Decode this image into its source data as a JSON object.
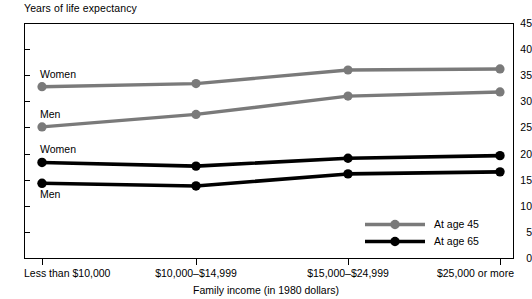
{
  "chart_data": {
    "type": "line",
    "title": "Black",
    "ylabel": "Years of life expectancy",
    "xlabel": "Family income (in 1980 dollars)",
    "categories": [
      "Less than $10,000",
      "$10,000–$14,999",
      "$15,000–$24,999",
      "$25,000 or more"
    ],
    "ylim": [
      0,
      45
    ],
    "yticks": [
      0,
      5,
      10,
      15,
      20,
      25,
      30,
      35,
      40,
      45
    ],
    "ytick_labels": [
      "0",
      "5",
      "10",
      "15",
      "20",
      "25",
      "30",
      "35",
      "40",
      "45"
    ],
    "grid": false,
    "legend_position": "inside-bottom-right",
    "series": [
      {
        "name": "At age 45 — Women",
        "label": "Women",
        "group": "At age 45",
        "color": "#7a7a7a",
        "values": [
          32.8,
          33.4,
          36.0,
          36.2
        ]
      },
      {
        "name": "At age 45 — Men",
        "label": "Men",
        "group": "At age 45",
        "color": "#7a7a7a",
        "values": [
          25.1,
          27.5,
          31.0,
          31.8
        ]
      },
      {
        "name": "At age 65 — Women",
        "label": "Women",
        "group": "At age 65",
        "color": "#000000",
        "values": [
          18.3,
          17.6,
          19.1,
          19.6
        ]
      },
      {
        "name": "At age 65 — Men",
        "label": "Men",
        "group": "At age 65",
        "color": "#000000",
        "values": [
          14.3,
          13.8,
          16.1,
          16.5
        ]
      }
    ],
    "annotations": [
      {
        "text": "Women",
        "series": "At age 45 — Women"
      },
      {
        "text": "Men",
        "series": "At age 45 — Men"
      },
      {
        "text": "Women",
        "series": "At age 65 — Women"
      },
      {
        "text": "Men",
        "series": "At age 65 — Men"
      }
    ],
    "legend": [
      {
        "label": "At age 45",
        "color": "#7a7a7a"
      },
      {
        "label": "At age 65",
        "color": "#000000"
      }
    ]
  }
}
